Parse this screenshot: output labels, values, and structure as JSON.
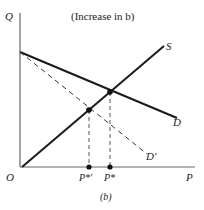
{
  "diagram": {
    "title": "(Increase in b)",
    "caption": "(b)",
    "axes": {
      "y_label": "Q",
      "x_label": "P",
      "origin_label": "O"
    },
    "curves": {
      "supply": "S",
      "demand": "D",
      "demand_shifted": "D'"
    },
    "ticks": {
      "p_star": "P*",
      "p_star_prime": "P*'"
    },
    "colors": {
      "line": "#1a1a1a",
      "dashed": "#333333",
      "axis": "#555555"
    }
  }
}
